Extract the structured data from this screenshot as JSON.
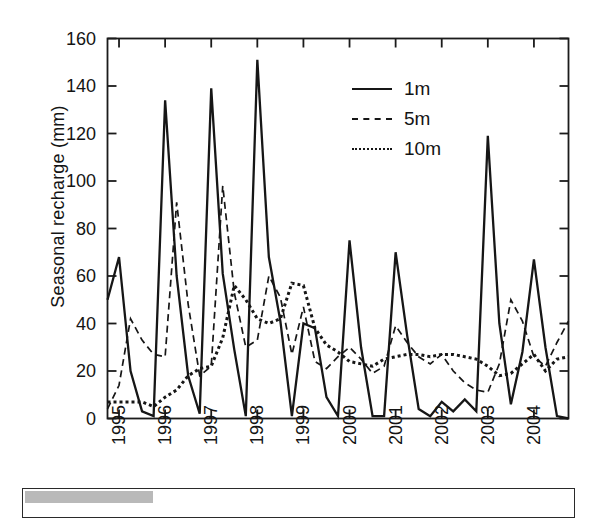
{
  "figure": {
    "ylabel": "Seasonal recharge (mm)",
    "legend": [
      {
        "label": "1m",
        "style": "solid"
      },
      {
        "label": "5m",
        "style": "dashed"
      },
      {
        "label": "10m",
        "style": "dotted"
      }
    ]
  },
  "chart_data": {
    "type": "line",
    "title": "",
    "xlabel": "",
    "ylabel": "Seasonal recharge (mm)",
    "ylim": [
      0,
      160
    ],
    "yticks": [
      0,
      20,
      40,
      60,
      80,
      100,
      120,
      140,
      160
    ],
    "xlim": [
      1994.75,
      2004.75
    ],
    "xticks": [
      1995,
      1996,
      1997,
      1998,
      1999,
      2000,
      2001,
      2002,
      2003,
      2004
    ],
    "xticklabels": [
      "1995",
      "1996",
      "1997",
      "1998",
      "1999",
      "2000",
      "2001",
      "2002",
      "2003",
      "2004"
    ],
    "grid": false,
    "legend_position": "upper-right-inside",
    "x": [
      1994.75,
      1995.0,
      1995.25,
      1995.5,
      1995.75,
      1996.0,
      1996.25,
      1996.5,
      1996.75,
      1997.0,
      1997.25,
      1997.5,
      1997.75,
      1998.0,
      1998.25,
      1998.5,
      1998.75,
      1999.0,
      1999.25,
      1999.5,
      1999.75,
      2000.0,
      2000.25,
      2000.5,
      2000.75,
      2001.0,
      2001.25,
      2001.5,
      2001.75,
      2002.0,
      2002.25,
      2002.5,
      2002.75,
      2003.0,
      2003.25,
      2003.5,
      2003.75,
      2004.0,
      2004.25,
      2004.5,
      2004.75
    ],
    "series": [
      {
        "name": "1m",
        "style": "solid",
        "values": [
          50,
          68,
          20,
          3,
          1,
          134,
          60,
          18,
          2,
          139,
          61,
          29,
          1,
          151,
          68,
          41,
          1,
          40,
          38,
          9,
          1,
          75,
          30,
          1,
          1,
          70,
          35,
          4,
          1,
          7,
          3,
          8,
          3,
          119,
          40,
          6,
          28,
          67,
          30,
          1,
          0
        ]
      },
      {
        "name": "5m",
        "style": "dashed",
        "values": [
          4,
          14,
          42,
          33,
          27,
          26,
          91,
          48,
          18,
          22,
          98,
          53,
          30,
          33,
          60,
          51,
          27,
          47,
          24,
          21,
          26,
          30,
          25,
          19,
          22,
          39,
          32,
          26,
          23,
          27,
          20,
          15,
          12,
          11,
          23,
          50,
          41,
          26,
          22,
          32,
          41
        ]
      },
      {
        "name": "10m",
        "style": "dotted",
        "values": [
          7,
          7,
          7,
          7,
          5,
          9,
          12,
          18,
          21,
          22,
          34,
          56,
          50,
          42,
          40,
          42,
          57,
          56,
          38,
          31,
          28,
          24,
          23,
          22,
          25,
          26,
          27,
          27,
          26,
          27,
          27,
          26,
          25,
          22,
          18,
          19,
          23,
          27,
          20,
          25,
          26
        ]
      }
    ]
  }
}
